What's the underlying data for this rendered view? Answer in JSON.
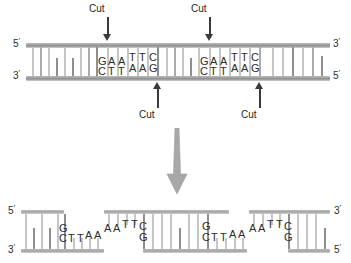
{
  "figure": {
    "colors": {
      "backbone": "#9d9d9d",
      "rung_light": "#c6c6c6",
      "rung_dark": "#8f8f8f",
      "text": "#2b2b2b",
      "arrow": "#3a3a3a",
      "big_arrow": "#a8a8a8"
    }
  },
  "top_molecule": {
    "left_end": {
      "top_label": "5",
      "bottom_label": "3"
    },
    "right_end": {
      "top_label": "3",
      "bottom_label": "5"
    },
    "recognition_sites": [
      {
        "top_sequence": "GAATTC",
        "bottom_sequence": "CTTAAG",
        "top_bases": [
          "G",
          "A",
          "A",
          "T",
          "T",
          "C"
        ],
        "bottom_bases": [
          "C",
          "T",
          "T",
          "A",
          "A",
          "G"
        ]
      },
      {
        "top_sequence": "GAATTC",
        "bottom_sequence": "CTTAAG",
        "top_bases": [
          "G",
          "A",
          "A",
          "T",
          "T",
          "C"
        ],
        "bottom_bases": [
          "C",
          "T",
          "T",
          "A",
          "A",
          "G"
        ]
      }
    ],
    "cut_labels": {
      "top_left": "Cut",
      "top_right": "Cut",
      "bottom_left": "Cut",
      "bottom_right": "Cut"
    }
  },
  "fragments": [
    {
      "name": "left-fragment",
      "left_end": {
        "top_label": "5",
        "bottom_label": "3"
      },
      "top_overhang_bases": [
        "G"
      ],
      "bottom_overhang_bases": [
        "C",
        "T",
        "T",
        "A",
        "A"
      ]
    },
    {
      "name": "middle-fragment",
      "left_top_bases": [
        "A",
        "A",
        "T",
        "T",
        "C"
      ],
      "left_bottom_bases": [
        "G"
      ],
      "right_top_bases": [
        "G"
      ],
      "right_bottom_bases": [
        "C",
        "T",
        "T",
        "A",
        "A"
      ]
    },
    {
      "name": "right-fragment",
      "right_end": {
        "top_label": "3",
        "bottom_label": "5"
      },
      "top_bases": [
        "A",
        "A",
        "T",
        "T",
        "C"
      ],
      "bottom_bases": [
        "G"
      ]
    }
  ]
}
